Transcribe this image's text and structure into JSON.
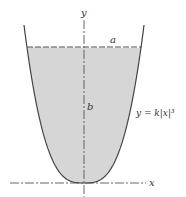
{
  "figure": {
    "labels": {
      "y_axis": "y",
      "x_axis": "x",
      "width": "a",
      "height": "b",
      "curve_equation": "y = k|x|³"
    },
    "colors": {
      "fill": "#d6d6d6",
      "stroke": "#444444",
      "axis": "#555555"
    },
    "curve": {
      "exponent": 3,
      "symmetric": true
    }
  }
}
